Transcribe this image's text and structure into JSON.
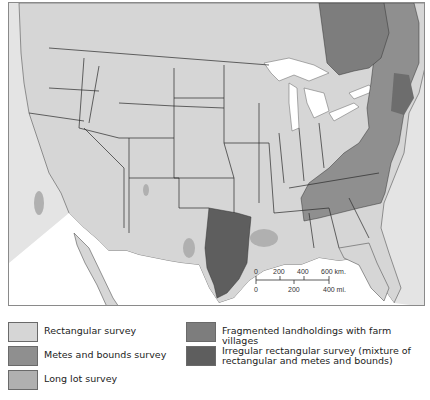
{
  "map": {
    "title": "",
    "region": "United States (lower 48) with southern Canada and northern Mexico",
    "colors": {
      "background_outside": "#e4e4e4",
      "rectangular": "#d6d6d6",
      "metes_and_bounds": "#8f8f8f",
      "long_lot": "#b0b0b0",
      "fragmented": "#7d7d7d",
      "irregular_rectangular": "#5e5e5e",
      "water": "#ffffff",
      "border": "#2a2a2a"
    },
    "scale_bar": {
      "km_ticks": [
        "0",
        "200",
        "400",
        "600 km."
      ],
      "mi_ticks": [
        "0",
        "200",
        "400 mi."
      ]
    }
  },
  "legend": {
    "items": [
      {
        "label": "Rectangular survey",
        "color": "#d6d6d6"
      },
      {
        "label": "Metes and bounds survey",
        "color": "#8f8f8f"
      },
      {
        "label": "Long lot survey",
        "color": "#b0b0b0"
      },
      {
        "label": "Fragmented landholdings with farm villages",
        "color": "#7d7d7d"
      },
      {
        "label": "Irregular rectangular survey (mixture of rectangular and metes and bounds)",
        "color": "#5e5e5e"
      }
    ]
  }
}
